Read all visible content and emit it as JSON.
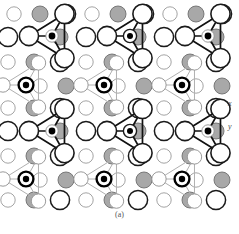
{
  "figure": {
    "caption": "(a)",
    "axes": {
      "x_label": "x",
      "y_label": "y"
    },
    "colors": {
      "background": "#ffffff",
      "substrate_gray_fill": "#a8a8a8",
      "substrate_gray_stroke": "#6e6e6e",
      "open_circle_fill": "#ffffff",
      "open_circle_stroke_light": "#9a9a9a",
      "open_circle_stroke_dark": "#1a1a1a",
      "cluster_dark_stroke": "#111111",
      "cluster_light_stroke": "#b0b0b0",
      "adatom_fill": "#000000"
    },
    "geometry": {
      "columns": 9,
      "rows": 6,
      "col_spacing": 26.0,
      "row_spacing": 33.5,
      "origin_x": 14,
      "origin_y": 14,
      "row_offset_x": -4.0,
      "radius_small_open": 7.2,
      "radius_gray": 8.0,
      "radius_large_open": 9.6,
      "radius_adatom_ring": 7.4,
      "radius_adatom_dot": 3.2
    },
    "lattice_rows": [
      {
        "index": 0,
        "kinds": [
          "open-light-small",
          "gray",
          "open-dark-large",
          "open-light-small",
          "gray",
          "open-dark-large",
          "open-light-small",
          "gray",
          "open-dark-large"
        ]
      },
      {
        "index": 1,
        "kinds": [
          "open-dark-large",
          "adatom-small-dark",
          "gray",
          "open-dark-large",
          "adatom-ring-dark",
          "gray",
          "open-dark-large",
          "adatom-small-dark",
          "gray"
        ]
      },
      {
        "index": 2,
        "kinds": [
          "open-light-small",
          "gray",
          "open-dark-large",
          "open-light-small",
          "gray",
          "open-dark-large",
          "open-light-small",
          "gray",
          "open-dark-large"
        ]
      },
      {
        "index": 3,
        "kinds": [
          "adatom-bullseye",
          "open-light-small",
          "gray",
          "adatom-bullseye",
          "open-light-small",
          "gray",
          "adatom-bullseye",
          "open-light-small",
          "gray"
        ]
      },
      {
        "index": 4,
        "kinds": [
          "open-light-small",
          "gray",
          "open-dark-large",
          "open-light-small",
          "gray",
          "open-dark-large",
          "open-light-small",
          "gray",
          "open-dark-large"
        ]
      },
      {
        "index": 5,
        "kinds": [
          "open-light-small",
          "gray",
          "open-dark-large",
          "open-light-small",
          "gray",
          "open-dark-large",
          "open-light-small",
          "gray",
          "open-dark-large"
        ]
      }
    ],
    "clusters": [
      {
        "id": "dark-cluster-1",
        "style": "dark",
        "row_band": "upper",
        "column_band": 0
      },
      {
        "id": "dark-cluster-2",
        "style": "dark",
        "row_band": "upper",
        "column_band": 1
      },
      {
        "id": "dark-cluster-3",
        "style": "dark",
        "row_band": "upper",
        "column_band": 2
      },
      {
        "id": "light-cluster-1",
        "style": "light",
        "row_band": "middle",
        "column_band": 0
      },
      {
        "id": "light-cluster-2",
        "style": "light",
        "row_band": "middle",
        "column_band": 1
      },
      {
        "id": "light-cluster-3",
        "style": "light",
        "row_band": "middle",
        "column_band": 2
      },
      {
        "id": "dark-cluster-4",
        "style": "dark",
        "row_band": "lower",
        "column_band": 0
      },
      {
        "id": "dark-cluster-5",
        "style": "dark",
        "row_band": "lower",
        "column_band": 1
      },
      {
        "id": "dark-cluster-6",
        "style": "dark",
        "row_band": "lower",
        "column_band": 2
      },
      {
        "id": "light-cluster-4",
        "style": "light",
        "row_band": "bottom",
        "column_band": 0
      },
      {
        "id": "light-cluster-5",
        "style": "light",
        "row_band": "bottom",
        "column_band": 1
      },
      {
        "id": "light-cluster-6",
        "style": "light",
        "row_band": "bottom",
        "column_band": 2
      }
    ]
  }
}
